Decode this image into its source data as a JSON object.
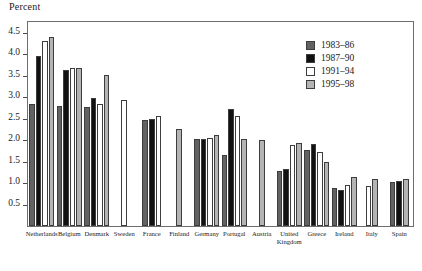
{
  "chart_data": {
    "type": "bar",
    "title": "",
    "subtitle": "",
    "xlabel": "",
    "ylabel": "Percent",
    "ylim": [
      0,
      4.75
    ],
    "yticks": [
      0.5,
      1.0,
      1.5,
      2.0,
      2.5,
      3.0,
      3.5,
      4.0,
      4.5
    ],
    "ytick_labels": [
      "0.5",
      "1.0",
      "1.5",
      "2.0",
      "2.5",
      "3.0",
      "3.5",
      "4.0",
      "4.5"
    ],
    "grid": false,
    "legend_position": "top-right",
    "categories": [
      "Netherlands",
      "Belgium",
      "Denmark",
      "Sweden",
      "France",
      "Finland",
      "Germany",
      "Portugal",
      "Austria",
      "United\nKingdom",
      "Greece",
      "Ireland",
      "Italy",
      "Spain"
    ],
    "series": [
      {
        "name": "1983–86",
        "color": "#626262",
        "values": [
          2.85,
          2.8,
          2.78,
          null,
          2.47,
          null,
          2.02,
          1.65,
          null,
          1.28,
          1.78,
          0.88,
          null,
          1.02
        ]
      },
      {
        "name": "1987–90",
        "color": "#111111",
        "values": [
          3.95,
          3.63,
          2.98,
          null,
          2.5,
          null,
          2.03,
          2.72,
          null,
          1.33,
          1.9,
          0.83,
          null,
          1.05
        ]
      },
      {
        "name": "1991–94",
        "color": "#ffffff",
        "values": [
          4.3,
          3.67,
          2.85,
          2.93,
          2.55,
          null,
          2.05,
          2.57,
          null,
          1.88,
          1.73,
          0.95,
          0.93,
          null
        ]
      },
      {
        "name": "1995–98",
        "color": "#b4b4b4",
        "values": [
          4.4,
          3.67,
          3.52,
          null,
          null,
          2.27,
          2.12,
          2.02,
          2.0,
          1.93,
          1.5,
          1.15,
          1.1,
          1.1
        ]
      }
    ]
  },
  "axis": {
    "y_title": "Percent"
  }
}
